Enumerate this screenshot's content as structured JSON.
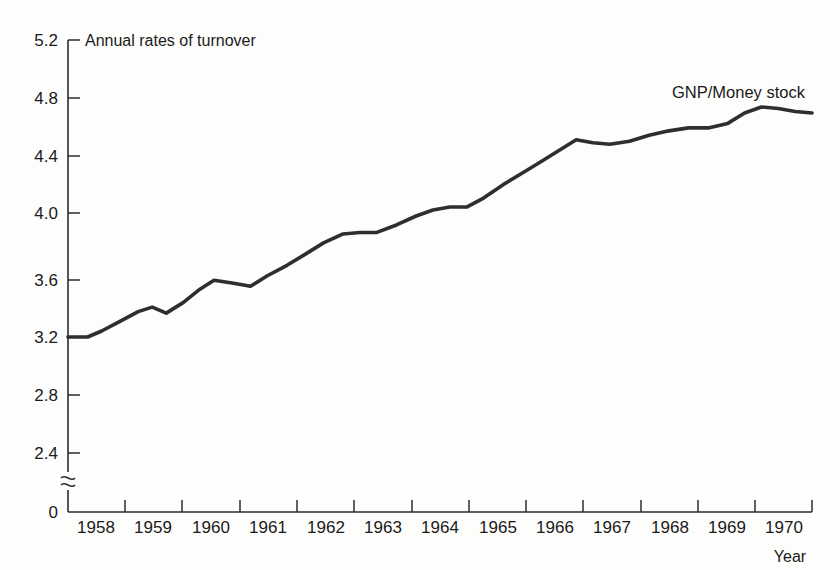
{
  "chart_data": {
    "type": "line",
    "title": "",
    "top_label": "Annual rates of turnover",
    "xlabel": "Year",
    "ylabel": "",
    "grid": false,
    "legend_position": "inline-right",
    "axis_break": true,
    "axis_break_symbol": "≈",
    "ylim": [
      2.2,
      5.2
    ],
    "yticks": [
      "0",
      "2.4",
      "2.8",
      "3.2",
      "3.6",
      "4.0",
      "4.4",
      "4.8",
      "5.2"
    ],
    "ytick_values": [
      0,
      2.4,
      2.8,
      3.2,
      3.6,
      4.0,
      4.4,
      4.8,
      5.2
    ],
    "xticks": [
      "1958",
      "1959",
      "1960",
      "1961",
      "1962",
      "1963",
      "1964",
      "1965",
      "1966",
      "1967",
      "1968",
      "1969",
      "1970"
    ],
    "xlim": [
      1957.5,
      1970.75
    ],
    "series": [
      {
        "name": "GNP/Money stock",
        "label": "GNP/Money stock",
        "color": "#2e2e2e",
        "x": [
          1957.5,
          1957.85,
          1958.1,
          1958.4,
          1958.75,
          1959.0,
          1959.25,
          1959.55,
          1959.85,
          1960.1,
          1960.45,
          1960.75,
          1961.05,
          1961.4,
          1961.75,
          1962.05,
          1962.4,
          1962.7,
          1963.0,
          1963.35,
          1963.7,
          1964.0,
          1964.3,
          1964.6,
          1964.9,
          1965.25,
          1965.6,
          1965.95,
          1966.25,
          1966.55,
          1966.85,
          1967.15,
          1967.5,
          1967.85,
          1968.2,
          1968.55,
          1968.9,
          1969.25,
          1969.55,
          1969.85,
          1970.15,
          1970.45,
          1970.75
        ],
        "y": [
          3.2,
          3.2,
          3.24,
          3.3,
          3.37,
          3.4,
          3.36,
          3.43,
          3.52,
          3.58,
          3.56,
          3.54,
          3.61,
          3.68,
          3.76,
          3.83,
          3.89,
          3.9,
          3.9,
          3.95,
          4.01,
          4.05,
          4.07,
          4.07,
          4.13,
          4.22,
          4.3,
          4.38,
          4.45,
          4.52,
          4.5,
          4.49,
          4.51,
          4.55,
          4.58,
          4.6,
          4.6,
          4.63,
          4.7,
          4.74,
          4.73,
          4.71,
          4.7
        ]
      }
    ],
    "annotations": [
      {
        "text": "Annual rates of turnover",
        "position": "top-left-of-axis"
      },
      {
        "text": "GNP/Money stock",
        "position": "upper-right"
      },
      {
        "text": "Year",
        "position": "bottom-right"
      }
    ]
  }
}
